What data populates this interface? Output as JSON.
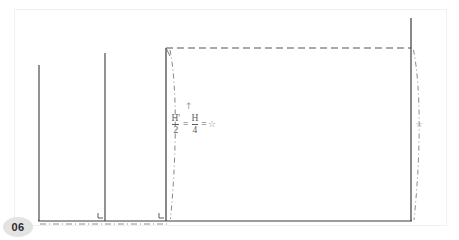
{
  "page": {
    "number_label": "06",
    "background_color": "#ffffff",
    "border_color": "#f2f2f2",
    "width": 459,
    "height": 240
  },
  "diagram": {
    "solid_line_color": "#3a3a3a",
    "dashed_line_color": "#555555",
    "dashdot_line_color": "#7a7a7a",
    "baseline": {
      "y": 221,
      "x_start": 38,
      "x_end": 412
    },
    "vertical_lines": [
      {
        "name": "left-wall-1",
        "x": 39,
        "y_top": 65,
        "y_bottom": 221
      },
      {
        "name": "left-wall-2",
        "x": 105,
        "y_top": 53,
        "y_bottom": 221
      },
      {
        "name": "center-wall",
        "x": 166,
        "y_top": 48,
        "y_bottom": 221
      },
      {
        "name": "right-wall",
        "x": 411,
        "y_top": 18,
        "y_bottom": 221
      }
    ],
    "dashed_top_line": {
      "x_start": 166,
      "x_end": 411,
      "y": 48
    },
    "dashdot_curves": [
      {
        "name": "left-profile-curve",
        "x_top": 170,
        "x_bulge": 176,
        "x_bottom": 170
      },
      {
        "name": "right-profile-curve",
        "x_top": 414,
        "x_bulge": 421,
        "x_bottom": 414
      }
    ],
    "dashdot_baseline": {
      "x_start": 40,
      "x_end": 168,
      "y": 224
    },
    "corner_markers": [
      {
        "name": "corner-marker-1",
        "x": 101,
        "y": 216
      },
      {
        "name": "corner-marker-2",
        "x": 162,
        "y": 216
      }
    ]
  },
  "annotations": {
    "formula": {
      "name": "height-ratio-formula",
      "numerator_1": "H'",
      "denominator_1": "2",
      "equals_1": "=",
      "numerator_2": "H",
      "denominator_2": "4",
      "equals_2": "=",
      "result_symbol": "☆",
      "plain_text": "H'/2 = H/4 = ☆"
    },
    "up_arrow": {
      "name": "up-arrow-marker",
      "glyph": "↑"
    },
    "right_star": {
      "name": "right-star-marker",
      "glyph": "☆"
    }
  }
}
